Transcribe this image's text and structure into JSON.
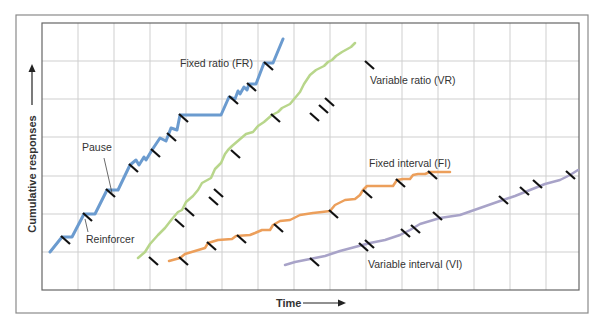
{
  "chart_data": {
    "type": "line",
    "title": "",
    "xlabel": "Time",
    "ylabel": "Cumulative responses",
    "grid": true,
    "legend_position": "inline labels",
    "frame": {
      "outer": [
        16,
        15,
        588,
        313
      ],
      "plot": [
        42,
        23,
        579,
        290
      ]
    },
    "grid_x": [
      78,
      114,
      150,
      186,
      222,
      258,
      294,
      330,
      366,
      402,
      438,
      474,
      510,
      546
    ],
    "grid_y": [
      61,
      99,
      137,
      176,
      214,
      252
    ],
    "series": [
      {
        "name": "Fixed ratio (FR)",
        "color": "#6b9bcf",
        "width": 3,
        "points": [
          [
            50,
            252
          ],
          [
            62,
            237
          ],
          [
            72,
            237
          ],
          [
            84,
            214
          ],
          [
            95,
            214
          ],
          [
            107,
            190
          ],
          [
            118,
            190
          ],
          [
            130,
            165
          ],
          [
            136,
            160
          ],
          [
            139,
            165
          ],
          [
            144,
            157
          ],
          [
            146,
            160
          ],
          [
            152,
            150
          ],
          [
            160,
            138
          ],
          [
            166,
            141
          ],
          [
            171,
            128
          ],
          [
            177,
            130
          ],
          [
            180,
            115
          ],
          [
            221,
            115
          ],
          [
            229,
            97
          ],
          [
            235,
            99
          ],
          [
            238,
            91
          ],
          [
            240,
            94
          ],
          [
            244,
            87
          ],
          [
            247,
            90
          ],
          [
            249,
            84
          ],
          [
            256,
            84
          ],
          [
            264,
            63
          ],
          [
            273,
            63
          ],
          [
            283,
            39
          ]
        ],
        "reinforcers": [
          [
            62,
            237
          ],
          [
            84,
            214
          ],
          [
            107,
            190
          ],
          [
            130,
            165
          ],
          [
            152,
            150
          ],
          [
            168,
            134
          ],
          [
            180,
            115
          ],
          [
            230,
            97
          ],
          [
            248,
            84
          ],
          [
            265,
            63
          ]
        ]
      },
      {
        "name": "Variable ratio (VR)",
        "color": "#b8d68b",
        "width": 2.5,
        "points": [
          [
            138,
            258
          ],
          [
            145,
            252
          ],
          [
            150,
            244
          ],
          [
            158,
            235
          ],
          [
            165,
            228
          ],
          [
            172,
            219
          ],
          [
            178,
            212
          ],
          [
            182,
            210
          ],
          [
            186,
            202
          ],
          [
            193,
            196
          ],
          [
            198,
            190
          ],
          [
            202,
            183
          ],
          [
            211,
            178
          ],
          [
            215,
            169
          ],
          [
            221,
            163
          ],
          [
            225,
            154
          ],
          [
            228,
            150
          ],
          [
            232,
            146
          ],
          [
            239,
            140
          ],
          [
            246,
            134
          ],
          [
            253,
            132
          ],
          [
            258,
            126
          ],
          [
            264,
            122
          ],
          [
            272,
            115
          ],
          [
            278,
            112
          ],
          [
            282,
            108
          ],
          [
            290,
            104
          ],
          [
            295,
            98
          ],
          [
            300,
            92
          ],
          [
            304,
            84
          ],
          [
            310,
            75
          ],
          [
            316,
            70
          ],
          [
            324,
            66
          ],
          [
            328,
            62
          ],
          [
            332,
            60
          ],
          [
            336,
            56
          ],
          [
            342,
            52
          ],
          [
            351,
            47
          ],
          [
            355,
            43
          ]
        ],
        "reinforcers": [
          [
            150,
            258
          ],
          [
            176,
            220
          ],
          [
            186,
            209
          ],
          [
            210,
            198
          ],
          [
            215,
            190
          ],
          [
            232,
            151
          ],
          [
            272,
            115
          ],
          [
            311,
            114
          ],
          [
            320,
            106
          ],
          [
            326,
            99
          ],
          [
            366,
            62
          ]
        ]
      },
      {
        "name": "Fixed interval (FI)",
        "color": "#ec9f5b",
        "width": 2.5,
        "points": [
          [
            169,
            261
          ],
          [
            180,
            258
          ],
          [
            185,
            254
          ],
          [
            195,
            251
          ],
          [
            205,
            248
          ],
          [
            208,
            243
          ],
          [
            218,
            240
          ],
          [
            232,
            239
          ],
          [
            236,
            236
          ],
          [
            250,
            235
          ],
          [
            255,
            233
          ],
          [
            262,
            230
          ],
          [
            270,
            230
          ],
          [
            273,
            225
          ],
          [
            280,
            221
          ],
          [
            290,
            220
          ],
          [
            300,
            215
          ],
          [
            313,
            213
          ],
          [
            322,
            212
          ],
          [
            330,
            211
          ],
          [
            335,
            205
          ],
          [
            345,
            200
          ],
          [
            355,
            199
          ],
          [
            360,
            195
          ],
          [
            363,
            190
          ],
          [
            367,
            186
          ],
          [
            375,
            186
          ],
          [
            385,
            186
          ],
          [
            393,
            186
          ],
          [
            397,
            180
          ],
          [
            403,
            179
          ],
          [
            410,
            179
          ],
          [
            413,
            175
          ],
          [
            418,
            174
          ],
          [
            425,
            174
          ],
          [
            430,
            172
          ],
          [
            440,
            172
          ],
          [
            450,
            172
          ]
        ],
        "reinforcers": [
          [
            180,
            258
          ],
          [
            208,
            243
          ],
          [
            238,
            236
          ],
          [
            275,
            225
          ],
          [
            330,
            211
          ],
          [
            364,
            191
          ],
          [
            397,
            180
          ],
          [
            429,
            172
          ]
        ]
      },
      {
        "name": "Variable interval (VI)",
        "color": "#a8a3c8",
        "width": 2.5,
        "points": [
          [
            285,
            265
          ],
          [
            295,
            262
          ],
          [
            310,
            259
          ],
          [
            325,
            256
          ],
          [
            340,
            251
          ],
          [
            355,
            247
          ],
          [
            370,
            243
          ],
          [
            385,
            240
          ],
          [
            400,
            235
          ],
          [
            410,
            230
          ],
          [
            420,
            224
          ],
          [
            440,
            218
          ],
          [
            460,
            215
          ],
          [
            480,
            208
          ],
          [
            500,
            201
          ],
          [
            515,
            196
          ],
          [
            530,
            190
          ],
          [
            545,
            184
          ],
          [
            560,
            180
          ],
          [
            570,
            175
          ],
          [
            578,
            170
          ]
        ],
        "reinforcers": [
          [
            311,
            259
          ],
          [
            360,
            244
          ],
          [
            366,
            241
          ],
          [
            402,
            230
          ],
          [
            412,
            226
          ],
          [
            434,
            213
          ],
          [
            500,
            197
          ],
          [
            521,
            188
          ],
          [
            534,
            181
          ],
          [
            567,
            172
          ]
        ]
      }
    ],
    "annotations": [
      {
        "text": "Fixed ratio (FR)",
        "x": 180,
        "y": 67
      },
      {
        "text": "Variable ratio (VR)",
        "x": 370,
        "y": 84
      },
      {
        "text": "Fixed interval (FI)",
        "x": 369,
        "y": 167
      },
      {
        "text": "Variable interval (VI)",
        "x": 368,
        "y": 268
      },
      {
        "text": "Pause",
        "x": 82,
        "y": 151
      },
      {
        "text": "Reinforcer",
        "x": 86,
        "y": 243
      }
    ],
    "pointers": [
      {
        "label": "Pause",
        "from": [
          104,
          158
        ],
        "to": [
          112,
          193
        ]
      },
      {
        "label": "Reinforcer",
        "from": [
          88,
          232
        ],
        "to": [
          85,
          219
        ]
      }
    ]
  },
  "axes": {
    "x_label": "Time",
    "y_label": "Cumulative responses"
  }
}
